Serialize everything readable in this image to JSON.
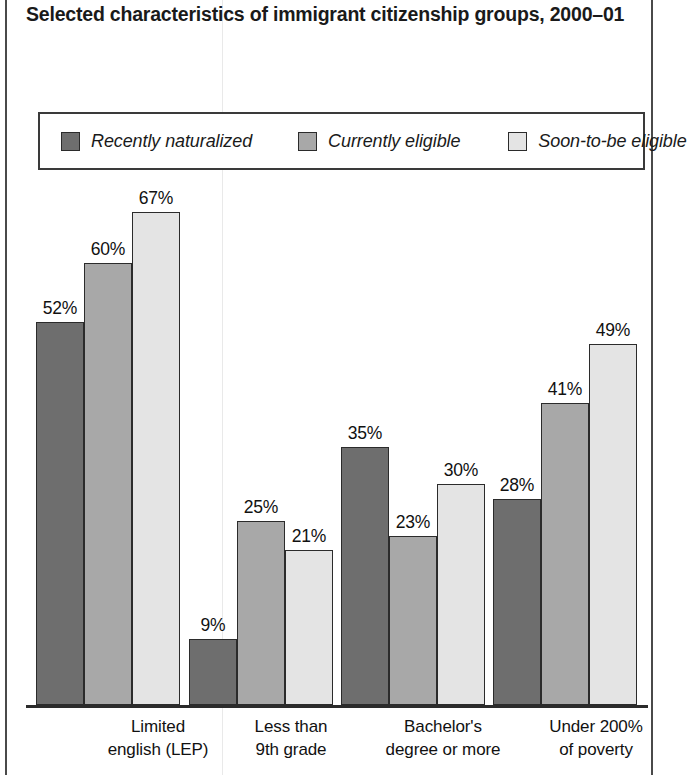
{
  "title": "Selected characteristics of immigrant citizenship groups, 2000–01",
  "legend": {
    "items": [
      {
        "label": "Recently naturalized",
        "color": "#6e6e6e"
      },
      {
        "label": "Currently eligible",
        "color": "#a8a8a8"
      },
      {
        "label": "Soon-to-be eligible",
        "color": "#e4e4e4"
      }
    ]
  },
  "chart_data": {
    "type": "bar",
    "title": "Selected characteristics of immigrant citizenship groups, 2000–01",
    "xlabel": "",
    "ylabel": "",
    "ylim": [
      0,
      67
    ],
    "grid": false,
    "legend_position": "top",
    "value_suffix": "%",
    "categories": [
      "Limited english (LEP)",
      "Less than 9th grade",
      "Bachelor's degree or more",
      "Under 200% of poverty"
    ],
    "category_lines": [
      [
        "Limited",
        "english (LEP)"
      ],
      [
        "Less than",
        "9th grade"
      ],
      [
        "Bachelor's",
        "degree or more"
      ],
      [
        "Under 200%",
        "of poverty"
      ]
    ],
    "series": [
      {
        "name": "Recently naturalized",
        "color": "#6e6e6e",
        "values": [
          52,
          9,
          35,
          28
        ],
        "labels": [
          "52%",
          "9%",
          "35%",
          "28%"
        ]
      },
      {
        "name": "Currently eligible",
        "color": "#a8a8a8",
        "values": [
          60,
          25,
          23,
          41
        ],
        "labels": [
          "60%",
          "25%",
          "23%",
          "41%"
        ]
      },
      {
        "name": "Soon-to-be eligible",
        "color": "#e4e4e4",
        "values": [
          67,
          21,
          30,
          49
        ],
        "labels": [
          "67%",
          "21%",
          "30%",
          "49%"
        ]
      }
    ]
  },
  "geometry": {
    "baseline_y": 705,
    "px_per_percent": 7.36,
    "bar_width": 48,
    "group_starts": [
      36,
      189,
      341,
      493
    ],
    "label_centers": [
      158,
      291,
      443,
      596
    ]
  }
}
